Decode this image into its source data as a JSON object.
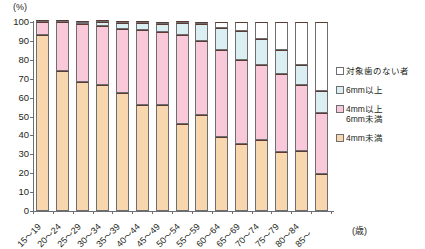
{
  "chart_data": {
    "type": "bar",
    "subtype": "stacked-100-percent",
    "title": "",
    "xlabel": "(歳)",
    "ylabel": "(%)",
    "ylim": [
      0,
      100
    ],
    "yticks": [
      0,
      10,
      20,
      30,
      40,
      50,
      60,
      70,
      80,
      90,
      100
    ],
    "grid": false,
    "legend_position": "right",
    "categories": [
      "15～19",
      "20～24",
      "25～29",
      "30～34",
      "35～39",
      "40～44",
      "45～49",
      "50～54",
      "55～59",
      "60～64",
      "65～69",
      "70～74",
      "75～79",
      "80～84",
      "85～"
    ],
    "series": [
      {
        "name": "4mm未満",
        "color": "#f8d6ae",
        "values": [
          93.0,
          74.0,
          68.0,
          66.5,
          62.5,
          56.0,
          56.0,
          46.0,
          51.0,
          39.0,
          35.5,
          37.5,
          31.0,
          31.5,
          19.5
        ]
      },
      {
        "name": "4mm以上\n6mm未満",
        "color": "#f9c9da",
        "values": [
          7.0,
          26.0,
          31.0,
          31.5,
          34.0,
          40.0,
          38.5,
          47.0,
          39.0,
          46.0,
          44.5,
          40.0,
          41.5,
          35.0,
          32.5
        ]
      },
      {
        "name": "6mm以上",
        "color": "#dbeef2",
        "values": [
          0.0,
          0.0,
          0.5,
          2.0,
          3.0,
          3.5,
          4.5,
          6.5,
          9.0,
          12.0,
          15.0,
          13.5,
          12.5,
          11.0,
          11.5
        ]
      },
      {
        "name": "対象歯のない者",
        "color": "#ffffff",
        "values": [
          0.0,
          0.0,
          0.5,
          0.0,
          0.5,
          0.5,
          1.0,
          0.5,
          1.0,
          3.0,
          5.0,
          9.0,
          15.0,
          22.5,
          36.5
        ]
      }
    ]
  },
  "legend": {
    "items": [
      {
        "label": "対象歯のない者",
        "swatch": "sw-none"
      },
      {
        "label": "6mm以上",
        "swatch": "sw-6plus"
      },
      {
        "label": "4mm以上\n6mm未満",
        "swatch": "sw-4to6"
      },
      {
        "label": "4mm未満",
        "swatch": "sw-under4"
      }
    ]
  }
}
